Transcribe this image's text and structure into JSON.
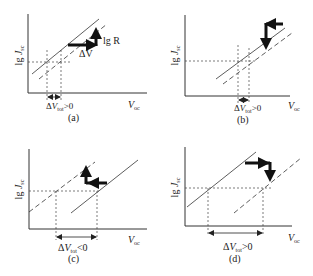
{
  "colors": {
    "ink": "#222222",
    "background": "#ffffff"
  },
  "axis_labels": {
    "y_prefix": "lg ",
    "y_var": "J",
    "y_sub": "sc",
    "x_var": "V",
    "x_sub": "oc"
  },
  "panels": [
    {
      "id": "a",
      "caption": "(a)",
      "delta_prefix": "Δ",
      "delta_var": "V",
      "delta_sub": "tot",
      "delta_relation": ">0",
      "arrow_labels": {
        "horizontal": "ΔV",
        "vertical": "lg R"
      }
    },
    {
      "id": "b",
      "caption": "(b)",
      "delta_prefix": "Δ",
      "delta_var": "V",
      "delta_sub": "tot",
      "delta_relation": ">0"
    },
    {
      "id": "c",
      "caption": "(c)",
      "delta_prefix": "Δ",
      "delta_var": "V",
      "delta_sub": "tot",
      "delta_relation": "<0"
    },
    {
      "id": "d",
      "caption": "(d)",
      "delta_prefix": "Δ",
      "delta_var": "V",
      "delta_sub": "tot",
      "delta_relation": ">0"
    }
  ]
}
